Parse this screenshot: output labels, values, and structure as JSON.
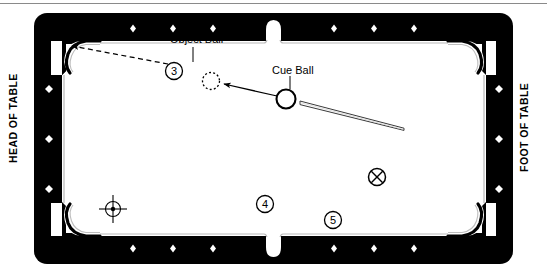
{
  "diagram": {
    "surface_color": "#ffffff",
    "rail_color": "#000000",
    "line_color": "#000000",
    "diamond_color": "#ffffff"
  },
  "labels": {
    "head_of_table": "HEAD OF TABLE",
    "foot_of_table": "FOOT OF TABLE",
    "object_ball": "Object Ball",
    "cue_ball": "Cue Ball"
  },
  "balls": [
    {
      "name": "object-ball-3",
      "label": "3",
      "x": 174,
      "y": 71,
      "r": 8.5,
      "style": "numbered"
    },
    {
      "name": "ball-4",
      "label": "4",
      "x": 265,
      "y": 204,
      "r": 8.5,
      "style": "numbered"
    },
    {
      "name": "ball-5",
      "label": "5",
      "x": 333,
      "y": 220,
      "r": 8.5,
      "style": "numbered"
    },
    {
      "name": "ball-x",
      "label": "X",
      "x": 377,
      "y": 177,
      "r": 8.5,
      "style": "crossed"
    },
    {
      "name": "cue-ball",
      "label": "",
      "x": 286,
      "y": 99,
      "r": 9.5,
      "style": "cue"
    },
    {
      "name": "ghost-ball",
      "label": "",
      "x": 211,
      "y": 81,
      "r": 8.5,
      "style": "ghost"
    }
  ],
  "markers": {
    "head_spot": {
      "name": "head-spot-crosshair",
      "x": 113,
      "y": 209,
      "radius": 7.5,
      "arm": 13,
      "dot": 2.2
    }
  },
  "lines": [
    {
      "name": "object-ball-to-pocket-line",
      "style": "dashed",
      "x1": 168,
      "y1": 64,
      "x2": 68,
      "y2": 45,
      "arrow": "end"
    },
    {
      "name": "cue-ball-to-ghost-ball-line",
      "style": "solid",
      "x1": 278,
      "y1": 96,
      "x2": 221,
      "y2": 83,
      "arrow": "end"
    },
    {
      "name": "cue-ball-leader-line",
      "style": "solid",
      "x1": 290,
      "y1": 75,
      "x2": 290,
      "y2": 89,
      "arrow": "none"
    },
    {
      "name": "object-ball-leader-line",
      "style": "solid",
      "x1": 193,
      "y1": 46,
      "x2": 193,
      "y2": 62,
      "arrow": "none"
    }
  ],
  "cue_stick": {
    "name": "cue-stick",
    "butt_x": 404,
    "butt_y": 130,
    "tip_x": 299,
    "tip_y": 102,
    "tip_width": 3.4,
    "butt_width": 1.6
  },
  "table": {
    "outer": {
      "x": 34,
      "y": 13,
      "w": 479,
      "h": 251,
      "radius": 13
    },
    "playfield": {
      "x": 62,
      "y": 38,
      "w": 423,
      "h": 201
    },
    "rail_thickness": 17,
    "pockets": [
      {
        "name": "pocket-top-left",
        "type": "corner"
      },
      {
        "name": "pocket-top-center",
        "type": "side"
      },
      {
        "name": "pocket-top-right",
        "type": "corner"
      },
      {
        "name": "pocket-bottom-left",
        "type": "corner"
      },
      {
        "name": "pocket-bottom-center",
        "type": "side"
      },
      {
        "name": "pocket-bottom-right",
        "type": "corner"
      }
    ],
    "diamonds": {
      "top": [
        {
          "x": 133
        },
        {
          "x": 173
        },
        {
          "x": 213
        },
        {
          "x": 334
        },
        {
          "x": 374
        },
        {
          "x": 414
        }
      ],
      "bottom": [
        {
          "x": 133
        },
        {
          "x": 173
        },
        {
          "x": 213
        },
        {
          "x": 334
        },
        {
          "x": 374
        },
        {
          "x": 414
        }
      ],
      "left": [
        {
          "y": 89
        },
        {
          "y": 139
        },
        {
          "y": 189
        }
      ],
      "right": [
        {
          "y": 89
        },
        {
          "y": 139
        },
        {
          "y": 189
        }
      ]
    }
  }
}
